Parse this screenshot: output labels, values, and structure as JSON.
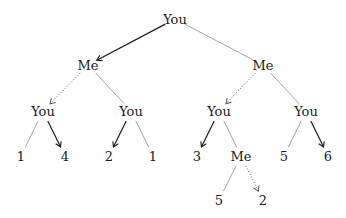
{
  "diagram": {
    "type": "game-tree",
    "nodes": [
      {
        "id": "root",
        "label": "You",
        "x": 175,
        "y": 19
      },
      {
        "id": "me_l",
        "label": "Me",
        "x": 88,
        "y": 65
      },
      {
        "id": "me_r",
        "label": "Me",
        "x": 263,
        "y": 65
      },
      {
        "id": "you_ll",
        "label": "You",
        "x": 43,
        "y": 111
      },
      {
        "id": "you_lr",
        "label": "You",
        "x": 131,
        "y": 111
      },
      {
        "id": "you_rl",
        "label": "You",
        "x": 219,
        "y": 111
      },
      {
        "id": "you_rr",
        "label": "You",
        "x": 306,
        "y": 111
      },
      {
        "id": "leaf_1",
        "label": "1",
        "x": 21,
        "y": 156
      },
      {
        "id": "leaf_2",
        "label": "4",
        "x": 65,
        "y": 156
      },
      {
        "id": "leaf_3",
        "label": "2",
        "x": 109,
        "y": 156
      },
      {
        "id": "leaf_4",
        "label": "1",
        "x": 153,
        "y": 156
      },
      {
        "id": "leaf_5",
        "label": "3",
        "x": 197,
        "y": 156
      },
      {
        "id": "me_rlr",
        "label": "Me",
        "x": 241,
        "y": 156
      },
      {
        "id": "leaf_6",
        "label": "5",
        "x": 284,
        "y": 156
      },
      {
        "id": "leaf_7",
        "label": "6",
        "x": 328,
        "y": 156
      },
      {
        "id": "leaf_8",
        "label": "5",
        "x": 219,
        "y": 200
      },
      {
        "id": "leaf_9",
        "label": "2",
        "x": 263,
        "y": 200
      }
    ],
    "edges": [
      {
        "from": "root",
        "to": "me_l",
        "style": "arrow"
      },
      {
        "from": "root",
        "to": "me_r",
        "style": "plain"
      },
      {
        "from": "me_l",
        "to": "you_ll",
        "style": "dotted-arrow"
      },
      {
        "from": "me_l",
        "to": "you_lr",
        "style": "plain"
      },
      {
        "from": "me_r",
        "to": "you_rl",
        "style": "dotted-arrow"
      },
      {
        "from": "me_r",
        "to": "you_rr",
        "style": "plain"
      },
      {
        "from": "you_ll",
        "to": "leaf_1",
        "style": "plain"
      },
      {
        "from": "you_ll",
        "to": "leaf_2",
        "style": "arrow"
      },
      {
        "from": "you_lr",
        "to": "leaf_3",
        "style": "arrow"
      },
      {
        "from": "you_lr",
        "to": "leaf_4",
        "style": "plain"
      },
      {
        "from": "you_rl",
        "to": "leaf_5",
        "style": "arrow"
      },
      {
        "from": "you_rl",
        "to": "me_rlr",
        "style": "plain"
      },
      {
        "from": "you_rr",
        "to": "leaf_6",
        "style": "plain"
      },
      {
        "from": "you_rr",
        "to": "leaf_7",
        "style": "arrow"
      },
      {
        "from": "me_rlr",
        "to": "leaf_8",
        "style": "plain"
      },
      {
        "from": "me_rlr",
        "to": "leaf_9",
        "style": "dotted-arrow"
      }
    ],
    "colors": {
      "plain": "#8a8a8a",
      "arrow": "#1a1a1a",
      "dotted": "#555555"
    }
  }
}
